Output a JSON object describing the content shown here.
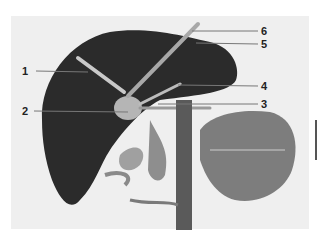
{
  "figure": {
    "labels": [
      {
        "id": "1",
        "text": "1"
      },
      {
        "id": "2",
        "text": "2"
      },
      {
        "id": "3",
        "text": "3"
      },
      {
        "id": "4",
        "text": "4"
      },
      {
        "id": "5",
        "text": "5"
      },
      {
        "id": "6",
        "text": "6"
      }
    ],
    "colors": {
      "background": "#efefef",
      "liver": "#2a2a2a",
      "vessels": "#8a8a8a",
      "highlight": "#c8c8c8"
    }
  }
}
